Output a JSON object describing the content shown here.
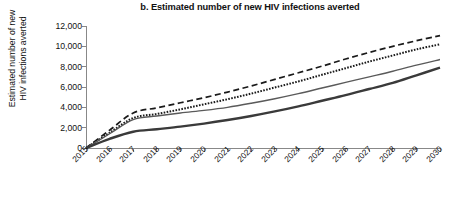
{
  "chart_data": {
    "type": "line",
    "title": "b. Estimated number of new HIV infections averted",
    "xlabel": "",
    "ylabel": "Estimated number of new\nHIV infections averted",
    "ylabel_line1": "Estimated number of new",
    "ylabel_line2": "HIV infections averted",
    "x": [
      2015,
      2016,
      2017,
      2018,
      2019,
      2020,
      2021,
      2022,
      2023,
      2024,
      2025,
      2026,
      2027,
      2028,
      2029,
      2030
    ],
    "categories": [
      "2015",
      "2016",
      "2017",
      "2018",
      "2019",
      "2020",
      "2021",
      "2022",
      "2023",
      "2024",
      "2025",
      "2026",
      "2027",
      "2028",
      "2029",
      "2030"
    ],
    "xlim": [
      2015,
      2030
    ],
    "ylim": [
      0,
      12000
    ],
    "yticks": [
      0,
      2000,
      4000,
      6000,
      8000,
      10000,
      12000
    ],
    "ytick_labels": [
      "0",
      "2,000",
      "4,000",
      "6,000",
      "8,000",
      "10,000",
      "12,000"
    ],
    "grid": false,
    "legend": "none",
    "series": [
      {
        "name": "dashed-scenario",
        "style": "dashed",
        "color": "#1a1a1a",
        "width": 1.7,
        "values": [
          0,
          1750,
          3450,
          3950,
          4450,
          4950,
          5500,
          6100,
          6750,
          7400,
          8050,
          8750,
          9400,
          10000,
          10550,
          11050
        ]
      },
      {
        "name": "dotted-scenario",
        "style": "dotted",
        "color": "#1a1a1a",
        "width": 2.0,
        "values": [
          0,
          1500,
          2950,
          3350,
          3800,
          4300,
          4800,
          5350,
          5950,
          6550,
          7200,
          7850,
          8500,
          9100,
          9700,
          10200
        ]
      },
      {
        "name": "thin-gray-scenario",
        "style": "solid-thin",
        "color": "#5a5a5a",
        "width": 1.4,
        "values": [
          0,
          1400,
          2800,
          3150,
          3450,
          3700,
          4000,
          4400,
          4850,
          5350,
          5900,
          6450,
          7000,
          7550,
          8150,
          8700
        ]
      },
      {
        "name": "thick-black-scenario",
        "style": "solid-thick",
        "color": "#3a3a3a",
        "width": 2.4,
        "values": [
          0,
          900,
          1600,
          1850,
          2100,
          2400,
          2750,
          3150,
          3600,
          4100,
          4650,
          5200,
          5800,
          6400,
          7150,
          7900
        ]
      }
    ]
  },
  "axes": {
    "axis_color": "#888888",
    "tick_color": "#888888"
  }
}
